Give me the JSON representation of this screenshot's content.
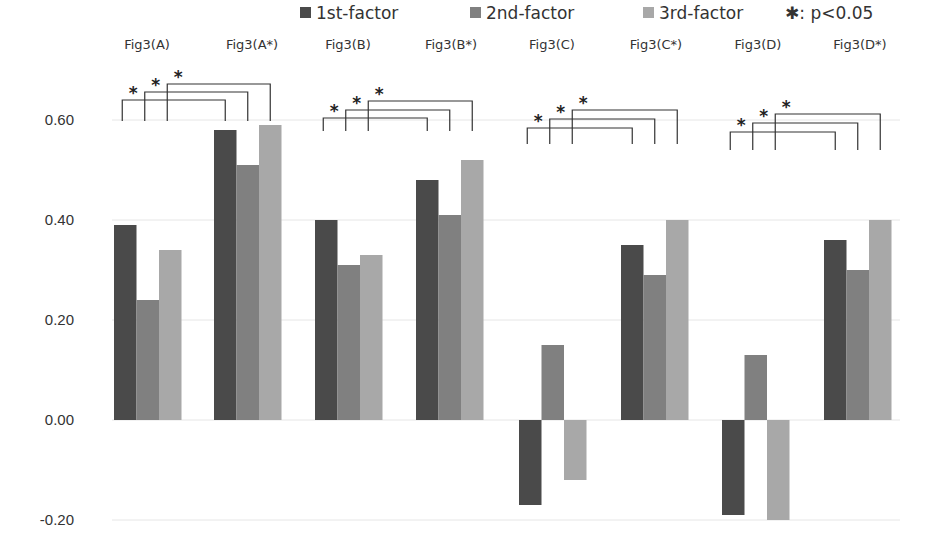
{
  "chart_data": {
    "type": "bar",
    "title": "",
    "xlabel": "",
    "ylabel": "",
    "ylim": [
      -0.2,
      0.6
    ],
    "yticks": [
      "-0.20",
      "0.00",
      "0.20",
      "0.40",
      "0.60"
    ],
    "grid": true,
    "legend_position": "top",
    "categories": [
      "Fig3(A)",
      "Fig3(A*)",
      "Fig3(B)",
      "Fig3(B*)",
      "Fig3(C)",
      "Fig3(C*)",
      "Fig3(D)",
      "Fig3(D*)"
    ],
    "series": [
      {
        "name": "1st-factor",
        "color": "#4a4a4a",
        "values": [
          0.39,
          0.58,
          0.4,
          0.48,
          -0.17,
          0.35,
          -0.19,
          0.36
        ]
      },
      {
        "name": "2nd-factor",
        "color": "#808080",
        "values": [
          0.24,
          0.51,
          0.31,
          0.41,
          0.15,
          0.29,
          0.13,
          0.3
        ]
      },
      {
        "name": "3rd-factor",
        "color": "#a8a8a8",
        "values": [
          0.34,
          0.59,
          0.33,
          0.52,
          -0.12,
          0.4,
          -0.2,
          0.4
        ]
      }
    ],
    "annotations": {
      "significance_legend": "✱: p<0.05",
      "significance_brackets": [
        {
          "from": "Fig3(A)",
          "to": "Fig3(A*)",
          "factors": [
            "1st-factor",
            "2nd-factor",
            "3rd-factor"
          ],
          "label": "*"
        },
        {
          "from": "Fig3(B)",
          "to": "Fig3(B*)",
          "factors": [
            "1st-factor",
            "2nd-factor",
            "3rd-factor"
          ],
          "label": "*"
        },
        {
          "from": "Fig3(C)",
          "to": "Fig3(C*)",
          "factors": [
            "1st-factor",
            "2nd-factor",
            "3rd-factor"
          ],
          "label": "*"
        },
        {
          "from": "Fig3(D)",
          "to": "Fig3(D*)",
          "factors": [
            "1st-factor",
            "2nd-factor",
            "3rd-factor"
          ],
          "label": "*"
        }
      ]
    }
  },
  "legend": {
    "items": [
      "1st-factor",
      "2nd-factor",
      "3rd-factor"
    ],
    "significance": "✱: p<0.05"
  }
}
